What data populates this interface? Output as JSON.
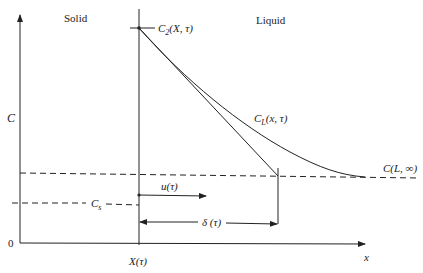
{
  "diagram": {
    "regions": {
      "solid": "Solid",
      "liquid": "Liquid"
    },
    "axes": {
      "y_label": "C",
      "x_label": "x",
      "origin_label": "0",
      "interface_label": "X(τ)"
    },
    "curves": {
      "interface_conc": "C",
      "interface_conc_sub": "2",
      "interface_conc_args": "(X, τ)",
      "liquid_profile": "C",
      "liquid_profile_sub": "L",
      "liquid_profile_args": "(x,  τ)",
      "far_field": "C(L, ∞)",
      "solid_conc": "C",
      "solid_conc_sub": "s"
    },
    "arrows": {
      "velocity": "u(τ)",
      "boundary_layer": "δ (τ)"
    },
    "colors": {
      "line": "#222222",
      "background": "#ffffff"
    }
  }
}
